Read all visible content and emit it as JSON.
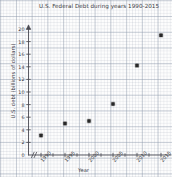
{
  "chart_data": {
    "type": "scatter",
    "title": "U.S. Federal Debt during years 1990-2015",
    "xlabel": "Year",
    "ylabel": "U.S. debt (billions of dollars)",
    "x": [
      1990,
      1995,
      2000,
      2005,
      2010,
      2015
    ],
    "values": [
      3.1,
      5.0,
      5.4,
      8.1,
      14.2,
      19.0
    ],
    "points": [
      {
        "x": 1990,
        "y": 3.1
      },
      {
        "x": 1995,
        "y": 5.0
      },
      {
        "x": 2000,
        "y": 5.4
      },
      {
        "x": 2005,
        "y": 8.1
      },
      {
        "x": 2010,
        "y": 14.2
      },
      {
        "x": 2015,
        "y": 19.0
      }
    ],
    "xlim": [
      1988,
      2017
    ],
    "ylim": [
      0,
      21
    ],
    "xticks": [
      1990,
      1995,
      2000,
      2005,
      2010,
      2015
    ],
    "xtick_labels": [
      "1990",
      "1995",
      "2000",
      "2005",
      "2010",
      "2015"
    ],
    "yticks": [
      0,
      2,
      4,
      6,
      8,
      10,
      12,
      14,
      16,
      18,
      20
    ],
    "ytick_labels": [
      "0",
      "2",
      "4",
      "6",
      "8",
      "10",
      "12",
      "14",
      "16",
      "18",
      "20"
    ],
    "grid": true,
    "legend": null,
    "axis_break_x": true,
    "marker_color": "#1c1c1c",
    "axis_color": "#4a4a52",
    "grid_color": "#8c98aa"
  },
  "axis": {
    "origin_label": "0"
  }
}
